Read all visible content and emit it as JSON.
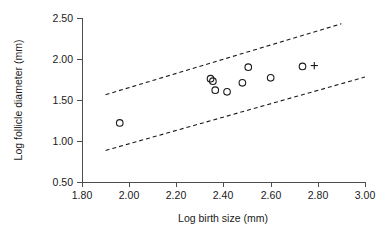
{
  "chart_data": {
    "type": "scatter",
    "title": "",
    "subtitle": "",
    "xlabel": "Log birth size (mm)",
    "ylabel": "Log follicle diameter (mm)",
    "xlim": [
      1.8,
      3.0
    ],
    "ylim": [
      0.5,
      2.5
    ],
    "xticks": [
      1.8,
      2.0,
      2.2,
      2.4,
      2.6,
      2.8,
      3.0
    ],
    "yticks": [
      0.5,
      1.0,
      1.5,
      2.0,
      2.5
    ],
    "xticklabels": [
      "1.80",
      "2.00",
      "2.20",
      "2.40",
      "2.60",
      "2.80",
      "3.00"
    ],
    "yticklabels": [
      "0.50",
      "1.00",
      "1.50",
      "2.00",
      "2.50"
    ],
    "grid": false,
    "legend": null,
    "series": [
      {
        "name": "observations",
        "marker": "open-circle",
        "points": [
          {
            "x": 1.96,
            "y": 1.22
          },
          {
            "x": 2.345,
            "y": 1.76
          },
          {
            "x": 2.355,
            "y": 1.73
          },
          {
            "x": 2.365,
            "y": 1.62
          },
          {
            "x": 2.415,
            "y": 1.6
          },
          {
            "x": 2.48,
            "y": 1.71
          },
          {
            "x": 2.505,
            "y": 1.9
          },
          {
            "x": 2.6,
            "y": 1.77
          },
          {
            "x": 2.735,
            "y": 1.91
          }
        ]
      },
      {
        "name": "highlighted",
        "marker": "plus",
        "points": [
          {
            "x": 2.785,
            "y": 1.92
          }
        ]
      }
    ],
    "annotations": [
      {
        "name": "upper-confidence-band",
        "style": "dashed",
        "x": [
          1.9,
          2.9
        ],
        "y": [
          1.565,
          2.43
        ]
      },
      {
        "name": "lower-confidence-band",
        "style": "dashed",
        "x": [
          1.9,
          3.0
        ],
        "y": [
          0.885,
          1.78
        ]
      }
    ]
  }
}
